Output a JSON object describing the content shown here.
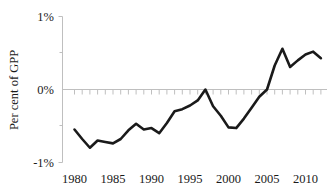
{
  "chart_data": {
    "type": "line",
    "title": "",
    "xlabel": "",
    "ylabel": "Per cent of GPP",
    "x": [
      1980,
      1981,
      1982,
      1983,
      1984,
      1985,
      1986,
      1987,
      1988,
      1989,
      1990,
      1991,
      1992,
      1993,
      1994,
      1995,
      1996,
      1997,
      1998,
      1999,
      2000,
      2001,
      2002,
      2003,
      2004,
      2005,
      2006,
      2007,
      2008,
      2009,
      2010,
      2011,
      2012
    ],
    "values": [
      -0.55,
      -0.68,
      -0.8,
      -0.7,
      -0.72,
      -0.74,
      -0.68,
      -0.56,
      -0.47,
      -0.55,
      -0.53,
      -0.6,
      -0.46,
      -0.3,
      -0.27,
      -0.22,
      -0.15,
      0.0,
      -0.23,
      -0.36,
      -0.52,
      -0.53,
      -0.4,
      -0.25,
      -0.1,
      0.0,
      0.33,
      0.56,
      0.31,
      0.4,
      0.48,
      0.52,
      0.43
    ],
    "series": [
      {
        "name": "Per cent of GPP",
        "values": [
          -0.55,
          -0.68,
          -0.8,
          -0.7,
          -0.72,
          -0.74,
          -0.68,
          -0.56,
          -0.47,
          -0.55,
          -0.53,
          -0.6,
          -0.46,
          -0.3,
          -0.27,
          -0.22,
          -0.15,
          0.0,
          -0.23,
          -0.36,
          -0.52,
          -0.53,
          -0.4,
          -0.25,
          -0.1,
          0.0,
          0.33,
          0.56,
          0.31,
          0.4,
          0.48,
          0.52,
          0.43
        ]
      }
    ],
    "xlim": [
      1979,
      2012.5
    ],
    "ylim": [
      -1,
      1
    ],
    "xticks": [
      1980,
      1985,
      1990,
      1995,
      2000,
      2005,
      2010
    ],
    "xtick_labels": [
      "1980",
      "1985",
      "1990",
      "1995",
      "2000",
      "2005",
      "2010"
    ],
    "yticks": [
      -1,
      0,
      1
    ],
    "ytick_labels": [
      "-1%",
      "0%",
      "1%"
    ],
    "y_minor_ticks": [
      -0.5,
      0.5
    ],
    "grid": false,
    "legend": false,
    "legend_position": "none",
    "line_color": "#1a1a1a",
    "axis_color": "#bfbfbf",
    "x_minor_tick_interval": 1,
    "zero_reference_line": true
  },
  "axes": {
    "y_axis_title": "Per cent of GPP",
    "y_tick_top": "1%",
    "y_tick_middle": "0%",
    "y_tick_bottom": "-1%",
    "x_tick_1": "1980",
    "x_tick_2": "1985",
    "x_tick_3": "1990",
    "x_tick_4": "1995",
    "x_tick_5": "2000",
    "x_tick_6": "2005",
    "x_tick_7": "2010"
  }
}
